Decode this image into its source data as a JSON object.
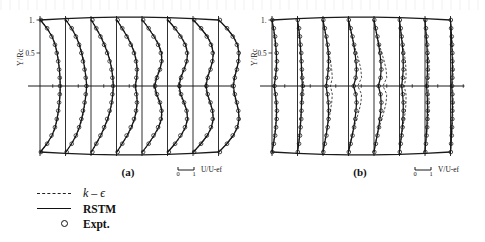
{
  "figure": {
    "kind": "scientific-figure-scan",
    "background_color": "#ffffff",
    "ink_color": "#111111"
  },
  "axes": {
    "y_axis_title": "Y/Rc",
    "y_ticks": [
      "1.",
      "0.5"
    ]
  },
  "panels": [
    {
      "id": "a",
      "label": "(a)",
      "x_axis_title": "U/U-ef",
      "scale_min": "0",
      "scale_max": "1"
    },
    {
      "id": "b",
      "label": "(b)",
      "x_axis_title": "V/U-ef",
      "scale_min": "0",
      "scale_max": "1"
    }
  ],
  "legend": {
    "items": [
      {
        "key": "dashed-line",
        "label": "k – ϵ",
        "style": "italic"
      },
      {
        "key": "solid-line",
        "label": "RSTM",
        "style": "bold"
      },
      {
        "key": "open-circle",
        "label": "Expt.",
        "style": "bold"
      }
    ]
  },
  "chart_data": {
    "type": "line",
    "title": "",
    "subtitle": "",
    "xlabel": "U/U-ef  (a) ;  V/U-ef  (b)",
    "ylabel": "Y/Rc",
    "ylim": [
      -1,
      1
    ],
    "xlim_per_station": [
      0,
      1
    ],
    "grid": false,
    "legend_position": "below-left",
    "series": [
      {
        "name": "k – ϵ",
        "style": "dashed"
      },
      {
        "name": "RSTM",
        "style": "solid"
      },
      {
        "name": "Expt.",
        "style": "open-circle-markers"
      }
    ],
    "y_values": [
      1.0,
      0.875,
      0.75,
      0.625,
      0.5,
      0.375,
      0.25,
      0.125,
      0.0,
      -0.125,
      -0.25,
      -0.375,
      -0.5,
      -0.625,
      -0.75,
      -0.875,
      -1.0
    ],
    "panel_a": {
      "panel": "(a)",
      "quantity": "U/U-ef",
      "n_stations": 8,
      "stations": [
        {
          "index": 1,
          "rstm": [
            0.02,
            0.3,
            0.52,
            0.66,
            0.74,
            0.8,
            0.84,
            0.87,
            0.88,
            0.87,
            0.84,
            0.8,
            0.74,
            0.66,
            0.52,
            0.3,
            0.02
          ],
          "ke": [
            0.02,
            0.32,
            0.54,
            0.67,
            0.75,
            0.81,
            0.85,
            0.87,
            0.88,
            0.87,
            0.85,
            0.81,
            0.75,
            0.67,
            0.54,
            0.32,
            0.02
          ],
          "expt": [
            0.04,
            0.31,
            0.5,
            0.65,
            0.73,
            0.79,
            0.83,
            0.86,
            0.87,
            0.86,
            0.83,
            0.79,
            0.73,
            0.65,
            0.5,
            0.31,
            0.04
          ]
        },
        {
          "index": 2,
          "rstm": [
            0.02,
            0.26,
            0.46,
            0.6,
            0.7,
            0.78,
            0.84,
            0.89,
            0.92,
            0.89,
            0.84,
            0.78,
            0.7,
            0.6,
            0.46,
            0.26,
            0.02
          ],
          "ke": [
            0.02,
            0.28,
            0.48,
            0.62,
            0.72,
            0.8,
            0.85,
            0.9,
            0.93,
            0.9,
            0.85,
            0.8,
            0.72,
            0.62,
            0.48,
            0.28,
            0.02
          ],
          "expt": [
            0.05,
            0.27,
            0.45,
            0.59,
            0.69,
            0.76,
            0.83,
            0.88,
            0.91,
            0.88,
            0.83,
            0.76,
            0.69,
            0.59,
            0.45,
            0.27,
            0.05
          ]
        },
        {
          "index": 3,
          "rstm": [
            0.02,
            0.22,
            0.42,
            0.58,
            0.72,
            0.83,
            0.9,
            0.95,
            0.97,
            0.95,
            0.9,
            0.83,
            0.72,
            0.58,
            0.42,
            0.22,
            0.02
          ],
          "ke": [
            0.02,
            0.24,
            0.45,
            0.61,
            0.74,
            0.84,
            0.91,
            0.95,
            0.97,
            0.95,
            0.91,
            0.84,
            0.74,
            0.61,
            0.45,
            0.24,
            0.02
          ],
          "expt": [
            0.06,
            0.23,
            0.41,
            0.57,
            0.7,
            0.81,
            0.89,
            0.93,
            0.96,
            0.93,
            0.89,
            0.81,
            0.7,
            0.57,
            0.41,
            0.23,
            0.06
          ]
        },
        {
          "index": 4,
          "rstm": [
            0.02,
            0.24,
            0.46,
            0.64,
            0.78,
            0.86,
            0.9,
            0.88,
            0.82,
            0.88,
            0.9,
            0.86,
            0.78,
            0.64,
            0.46,
            0.24,
            0.02
          ],
          "ke": [
            0.02,
            0.26,
            0.49,
            0.67,
            0.8,
            0.87,
            0.9,
            0.87,
            0.8,
            0.87,
            0.9,
            0.87,
            0.8,
            0.67,
            0.49,
            0.26,
            0.02
          ],
          "expt": [
            0.05,
            0.25,
            0.44,
            0.62,
            0.76,
            0.85,
            0.89,
            0.86,
            0.8,
            0.86,
            0.89,
            0.85,
            0.76,
            0.62,
            0.44,
            0.25,
            0.05
          ]
        },
        {
          "index": 5,
          "rstm": [
            0.02,
            0.28,
            0.52,
            0.72,
            0.84,
            0.86,
            0.78,
            0.64,
            0.55,
            0.64,
            0.78,
            0.86,
            0.84,
            0.72,
            0.52,
            0.28,
            0.02
          ],
          "ke": [
            0.02,
            0.3,
            0.55,
            0.75,
            0.86,
            0.87,
            0.76,
            0.6,
            0.5,
            0.6,
            0.76,
            0.87,
            0.86,
            0.75,
            0.55,
            0.3,
            0.02
          ],
          "expt": [
            0.05,
            0.29,
            0.5,
            0.7,
            0.82,
            0.85,
            0.78,
            0.65,
            0.57,
            0.65,
            0.78,
            0.85,
            0.82,
            0.7,
            0.5,
            0.29,
            0.05
          ]
        },
        {
          "index": 6,
          "rstm": [
            0.02,
            0.32,
            0.58,
            0.78,
            0.87,
            0.84,
            0.72,
            0.58,
            0.5,
            0.58,
            0.72,
            0.84,
            0.87,
            0.78,
            0.58,
            0.32,
            0.02
          ],
          "ke": [
            0.02,
            0.34,
            0.61,
            0.8,
            0.88,
            0.84,
            0.7,
            0.54,
            0.46,
            0.54,
            0.7,
            0.84,
            0.88,
            0.8,
            0.61,
            0.34,
            0.02
          ],
          "expt": [
            0.06,
            0.33,
            0.56,
            0.76,
            0.85,
            0.83,
            0.72,
            0.59,
            0.52,
            0.59,
            0.72,
            0.83,
            0.85,
            0.76,
            0.56,
            0.33,
            0.06
          ]
        },
        {
          "index": 7,
          "rstm": [
            0.02,
            0.34,
            0.62,
            0.8,
            0.88,
            0.85,
            0.75,
            0.63,
            0.57,
            0.63,
            0.75,
            0.85,
            0.88,
            0.8,
            0.62,
            0.34,
            0.02
          ],
          "ke": [
            0.02,
            0.36,
            0.64,
            0.82,
            0.89,
            0.85,
            0.73,
            0.6,
            0.54,
            0.6,
            0.73,
            0.85,
            0.89,
            0.82,
            0.64,
            0.36,
            0.02
          ],
          "expt": [
            0.05,
            0.35,
            0.6,
            0.78,
            0.86,
            0.84,
            0.76,
            0.64,
            0.58,
            0.64,
            0.76,
            0.84,
            0.86,
            0.78,
            0.6,
            0.35,
            0.05
          ]
        },
        {
          "index": 8,
          "rstm": [
            0.02,
            0.36,
            0.64,
            0.82,
            0.89,
            0.87,
            0.79,
            0.7,
            0.65,
            0.7,
            0.79,
            0.87,
            0.89,
            0.82,
            0.64,
            0.36,
            0.02
          ],
          "ke": [
            0.02,
            0.38,
            0.66,
            0.84,
            0.9,
            0.87,
            0.77,
            0.67,
            0.62,
            0.67,
            0.77,
            0.87,
            0.9,
            0.84,
            0.66,
            0.38,
            0.02
          ],
          "expt": [
            0.06,
            0.37,
            0.62,
            0.8,
            0.88,
            0.86,
            0.8,
            0.71,
            0.66,
            0.71,
            0.8,
            0.86,
            0.88,
            0.8,
            0.62,
            0.37,
            0.06
          ]
        }
      ]
    },
    "panel_b": {
      "panel": "(b)",
      "quantity": "V/U-ef",
      "n_stations": 8,
      "stations": [
        {
          "index": 1,
          "rstm": [
            0.0,
            0.05,
            0.09,
            0.12,
            0.14,
            0.15,
            0.14,
            0.11,
            0.07,
            0.11,
            0.14,
            0.15,
            0.14,
            0.12,
            0.09,
            0.05,
            0.0
          ],
          "ke": [
            0.0,
            0.04,
            0.08,
            0.11,
            0.13,
            0.14,
            0.13,
            0.1,
            0.06,
            0.1,
            0.13,
            0.14,
            0.13,
            0.11,
            0.08,
            0.04,
            0.0
          ],
          "expt": [
            0.01,
            0.06,
            0.1,
            0.13,
            0.15,
            0.16,
            0.14,
            0.12,
            0.08,
            0.12,
            0.14,
            0.16,
            0.15,
            0.13,
            0.1,
            0.06,
            0.01
          ]
        },
        {
          "index": 2,
          "rstm": [
            0.0,
            0.04,
            0.07,
            0.09,
            0.11,
            0.12,
            0.13,
            0.14,
            0.16,
            0.14,
            0.13,
            0.12,
            0.11,
            0.09,
            0.07,
            0.04,
            0.0
          ],
          "ke": [
            0.0,
            0.03,
            0.06,
            0.08,
            0.1,
            0.12,
            0.14,
            0.17,
            0.21,
            0.17,
            0.14,
            0.12,
            0.1,
            0.08,
            0.06,
            0.03,
            0.0
          ],
          "expt": [
            0.01,
            0.05,
            0.08,
            0.1,
            0.12,
            0.13,
            0.14,
            0.15,
            0.17,
            0.15,
            0.14,
            0.13,
            0.12,
            0.1,
            0.08,
            0.05,
            0.01
          ]
        },
        {
          "index": 3,
          "rstm": [
            0.0,
            0.05,
            0.1,
            0.14,
            0.17,
            0.18,
            0.17,
            0.14,
            0.1,
            0.14,
            0.17,
            0.18,
            0.17,
            0.14,
            0.1,
            0.05,
            0.0
          ],
          "ke": [
            0.0,
            0.04,
            0.09,
            0.14,
            0.19,
            0.24,
            0.28,
            0.3,
            0.24,
            0.3,
            0.28,
            0.24,
            0.19,
            0.14,
            0.09,
            0.04,
            0.0
          ],
          "expt": [
            0.01,
            0.06,
            0.11,
            0.15,
            0.18,
            0.19,
            0.18,
            0.15,
            0.11,
            0.15,
            0.18,
            0.19,
            0.18,
            0.15,
            0.11,
            0.06,
            0.01
          ]
        },
        {
          "index": 4,
          "rstm": [
            0.0,
            0.06,
            0.12,
            0.17,
            0.21,
            0.24,
            0.26,
            0.24,
            0.16,
            0.24,
            0.26,
            0.24,
            0.21,
            0.17,
            0.12,
            0.06,
            0.0
          ],
          "ke": [
            0.0,
            0.05,
            0.11,
            0.18,
            0.26,
            0.34,
            0.4,
            0.42,
            0.3,
            0.42,
            0.4,
            0.34,
            0.26,
            0.18,
            0.11,
            0.05,
            0.0
          ],
          "expt": [
            0.01,
            0.07,
            0.13,
            0.18,
            0.22,
            0.25,
            0.26,
            0.23,
            0.17,
            0.23,
            0.26,
            0.25,
            0.22,
            0.18,
            0.13,
            0.07,
            0.01
          ]
        },
        {
          "index": 5,
          "rstm": [
            0.0,
            0.05,
            0.1,
            0.15,
            0.19,
            0.22,
            0.23,
            0.21,
            0.14,
            0.21,
            0.23,
            0.22,
            0.19,
            0.15,
            0.1,
            0.05,
            0.0
          ],
          "ke": [
            0.0,
            0.04,
            0.1,
            0.17,
            0.25,
            0.33,
            0.39,
            0.41,
            0.29,
            0.41,
            0.39,
            0.33,
            0.25,
            0.17,
            0.1,
            0.04,
            0.0
          ],
          "expt": [
            0.01,
            0.06,
            0.11,
            0.16,
            0.2,
            0.23,
            0.24,
            0.21,
            0.15,
            0.21,
            0.24,
            0.23,
            0.2,
            0.16,
            0.11,
            0.06,
            0.01
          ]
        },
        {
          "index": 6,
          "rstm": [
            0.0,
            0.03,
            0.06,
            0.09,
            0.11,
            0.12,
            0.12,
            0.1,
            0.07,
            0.1,
            0.12,
            0.12,
            0.11,
            0.09,
            0.06,
            0.03,
            0.0
          ],
          "ke": [
            0.0,
            0.03,
            0.07,
            0.11,
            0.15,
            0.19,
            0.21,
            0.21,
            0.15,
            0.21,
            0.21,
            0.19,
            0.15,
            0.11,
            0.07,
            0.03,
            0.0
          ],
          "expt": [
            0.01,
            0.04,
            0.07,
            0.1,
            0.12,
            0.13,
            0.13,
            0.11,
            0.08,
            0.11,
            0.13,
            0.13,
            0.12,
            0.1,
            0.07,
            0.04,
            0.01
          ]
        },
        {
          "index": 7,
          "rstm": [
            0.0,
            0.02,
            0.04,
            0.06,
            0.07,
            0.08,
            0.08,
            0.07,
            0.05,
            0.07,
            0.08,
            0.08,
            0.07,
            0.06,
            0.04,
            0.02,
            0.0
          ],
          "ke": [
            0.0,
            0.02,
            0.05,
            0.08,
            0.1,
            0.12,
            0.13,
            0.12,
            0.09,
            0.12,
            0.13,
            0.12,
            0.1,
            0.08,
            0.05,
            0.02,
            0.0
          ],
          "expt": [
            0.01,
            0.03,
            0.05,
            0.07,
            0.08,
            0.09,
            0.09,
            0.08,
            0.06,
            0.08,
            0.09,
            0.09,
            0.08,
            0.07,
            0.05,
            0.03,
            0.01
          ]
        },
        {
          "index": 8,
          "rstm": [
            0.0,
            0.02,
            0.03,
            0.04,
            0.05,
            0.06,
            0.06,
            0.05,
            0.04,
            0.05,
            0.06,
            0.06,
            0.05,
            0.04,
            0.03,
            0.02,
            0.0
          ],
          "ke": [
            0.0,
            0.02,
            0.04,
            0.06,
            0.07,
            0.08,
            0.09,
            0.08,
            0.06,
            0.08,
            0.09,
            0.08,
            0.07,
            0.06,
            0.04,
            0.02,
            0.0
          ],
          "expt": [
            0.01,
            0.02,
            0.04,
            0.05,
            0.06,
            0.06,
            0.07,
            0.06,
            0.05,
            0.06,
            0.07,
            0.06,
            0.06,
            0.05,
            0.04,
            0.02,
            0.01
          ]
        }
      ]
    }
  }
}
